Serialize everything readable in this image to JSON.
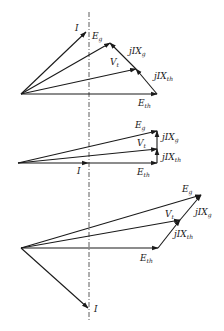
{
  "diagram": {
    "panels": [
      {
        "name": "top",
        "origin": [
          21,
          94
        ],
        "tips": {
          "I": [
            86,
            32
          ],
          "Eg": [
            110,
            43
          ],
          "Vt": [
            136,
            69
          ],
          "Eth": [
            157,
            94
          ]
        },
        "labels": {
          "I": "I",
          "Eg": "E",
          "Eg_sub": "g",
          "Vt": "V",
          "Vt_sub": "t",
          "jIXg": "jIX",
          "jIXg_sub": "g",
          "jIXth": "jIX",
          "jIXth_sub": "th",
          "Eth": "E",
          "Eth_sub": "th"
        }
      },
      {
        "name": "middle",
        "origin": [
          18,
          163
        ],
        "tips": {
          "I": [
            88,
            163
          ],
          "Eg": [
            157,
            131
          ],
          "Vt": [
            157,
            149
          ],
          "Eth": [
            157,
            163
          ]
        },
        "labels": {
          "I": "I",
          "Eg": "E",
          "Eg_sub": "g",
          "Vt": "V",
          "Vt_sub": "t",
          "jIXg": "jIX",
          "jIXg_sub": "g",
          "jIXth": "jIX",
          "jIXth_sub": "th",
          "Eth": "E",
          "Eth_sub": "th"
        }
      },
      {
        "name": "bottom",
        "origin": [
          21,
          248
        ],
        "tips": {
          "I": [
            88,
            308
          ],
          "Eg": [
            201,
            195
          ],
          "Vt": [
            180,
            220
          ],
          "Eth": [
            158,
            248
          ]
        },
        "labels": {
          "I": "I",
          "Eg": "E",
          "Eg_sub": "g",
          "Vt": "V",
          "Vt_sub": "t",
          "jIXg": "jIX",
          "jIXg_sub": "g",
          "jIXth": "jIX",
          "jIXth_sub": "th",
          "Eth": "E",
          "Eth_sub": "th"
        }
      }
    ],
    "reference_line": {
      "x": 89,
      "y_start": 12,
      "y_end": 320
    }
  }
}
